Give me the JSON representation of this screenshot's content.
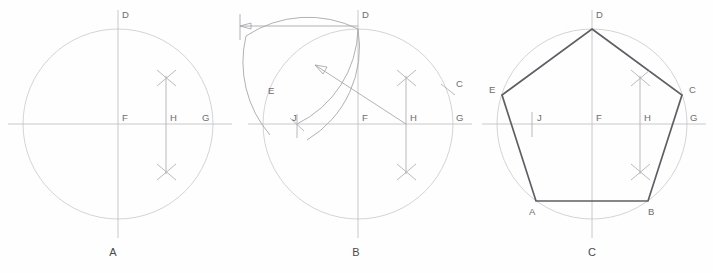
{
  "figure": {
    "width": 713,
    "height": 273,
    "background": "#fefefe"
  },
  "colors": {
    "circle": "#c9c9cc",
    "centerline": "#bdbdc2",
    "construction": "#a8a8ae",
    "arc": "#a3a3a9",
    "polygon": "#5e5e64",
    "label_text": "#6d6d6d",
    "panel_label_text": "#4a4a4a"
  },
  "panels": [
    {
      "id": "A",
      "label": "A",
      "label_x": 113,
      "label_y": 256,
      "center": {
        "x": 118,
        "y": 124
      },
      "radius": 95,
      "points": [
        {
          "name": "D",
          "x": 118,
          "y": 29,
          "label": "D",
          "label_x": 122,
          "label_y": 18
        },
        {
          "name": "F",
          "x": 118,
          "y": 124,
          "label": "F",
          "label_x": 122,
          "label_y": 121
        },
        {
          "name": "H",
          "x": 166,
          "y": 124,
          "label": "H",
          "label_x": 170,
          "label_y": 121
        },
        {
          "name": "G",
          "x": 213,
          "y": 124,
          "label": "G",
          "label_x": 202,
          "label_y": 121
        }
      ],
      "cross_marks": [
        {
          "x": 166,
          "y": 78
        },
        {
          "x": 166,
          "y": 172
        }
      ]
    },
    {
      "id": "B",
      "label": "B",
      "label_x": 356,
      "label_y": 256,
      "center": {
        "x": 358,
        "y": 124
      },
      "radius": 95,
      "points": [
        {
          "name": "D",
          "x": 358,
          "y": 29,
          "label": "D",
          "label_x": 362,
          "label_y": 18
        },
        {
          "name": "E",
          "x": 277,
          "y": 97,
          "label": "E",
          "label_x": 268,
          "label_y": 94
        },
        {
          "name": "J",
          "x": 297,
          "y": 124,
          "label": "J",
          "label_x": 292,
          "label_y": 121
        },
        {
          "name": "F",
          "x": 358,
          "y": 124,
          "label": "F",
          "label_x": 362,
          "label_y": 121
        },
        {
          "name": "H",
          "x": 406,
          "y": 124,
          "label": "H",
          "label_x": 410,
          "label_y": 121
        },
        {
          "name": "C",
          "x": 448,
          "y": 90,
          "label": "C",
          "label_x": 456,
          "label_y": 87
        },
        {
          "name": "G",
          "x": 453,
          "y": 124,
          "label": "G",
          "label_x": 456,
          "label_y": 121
        }
      ],
      "cross_marks": [
        {
          "x": 406,
          "y": 78
        },
        {
          "x": 406,
          "y": 172
        }
      ],
      "dimension": {
        "from_x": 240,
        "to_x": 358,
        "y": 26,
        "arrow_at": "left"
      },
      "radius_arrow": {
        "from_x": 406,
        "from_y": 124,
        "to_x": 315,
        "to_y": 65
      }
    },
    {
      "id": "C",
      "label": "C",
      "label_x": 592,
      "label_y": 256,
      "center": {
        "x": 592,
        "y": 124
      },
      "radius": 95,
      "points": [
        {
          "name": "D",
          "x": 592,
          "y": 29,
          "label": "D",
          "label_x": 596,
          "label_y": 18
        },
        {
          "name": "E",
          "x": 502,
          "y": 95,
          "label": "E",
          "label_x": 489,
          "label_y": 93
        },
        {
          "name": "C",
          "x": 682,
          "y": 95,
          "label": "C",
          "label_x": 689,
          "label_y": 93
        },
        {
          "name": "A",
          "x": 536,
          "y": 201,
          "label": "A",
          "label_x": 529,
          "label_y": 215
        },
        {
          "name": "B",
          "x": 648,
          "y": 201,
          "label": "B",
          "label_x": 648,
          "label_y": 215
        },
        {
          "name": "J",
          "x": 532,
          "y": 124,
          "label": "J",
          "label_x": 537,
          "label_y": 121
        },
        {
          "name": "F",
          "x": 592,
          "y": 124,
          "label": "F",
          "label_x": 596,
          "label_y": 121
        },
        {
          "name": "H",
          "x": 640,
          "y": 124,
          "label": "H",
          "label_x": 644,
          "label_y": 121
        },
        {
          "name": "G",
          "x": 687,
          "y": 124,
          "label": "G",
          "label_x": 690,
          "label_y": 121
        }
      ],
      "cross_marks": [
        {
          "x": 640,
          "y": 78
        },
        {
          "x": 640,
          "y": 172
        }
      ],
      "polygon_vertices": [
        "D",
        "C",
        "B",
        "A",
        "E"
      ]
    }
  ]
}
